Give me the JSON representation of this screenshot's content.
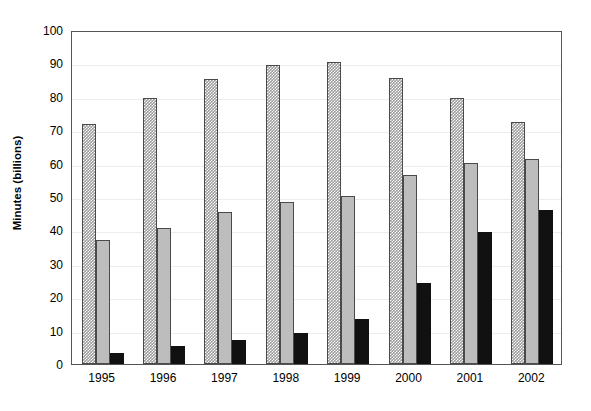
{
  "chart_data": {
    "type": "bar",
    "title": "",
    "subtitle": "",
    "xlabel": "",
    "ylabel": "Minutes (billions)",
    "categories": [
      "1995",
      "1996",
      "1997",
      "1998",
      "1999",
      "2000",
      "2001",
      "2002"
    ],
    "series": [
      {
        "name": "series-1",
        "style": "dotted-pattern-gray",
        "color": "#9a9a9a",
        "values": [
          72.0,
          79.5,
          85.3,
          89.5,
          90.5,
          85.5,
          79.7,
          72.5
        ]
      },
      {
        "name": "series-2",
        "style": "solid-light-gray",
        "color": "#bdbdbd",
        "values": [
          37.0,
          40.8,
          45.5,
          48.5,
          50.3,
          56.5,
          60.3,
          61.5
        ]
      },
      {
        "name": "series-3",
        "style": "solid-black",
        "color": "#111111",
        "values": [
          3.3,
          5.3,
          7.2,
          9.2,
          13.5,
          24.3,
          39.5,
          46.0
        ]
      }
    ],
    "ylim": [
      0,
      100
    ],
    "yticks": [
      0,
      10,
      20,
      30,
      40,
      50,
      60,
      70,
      80,
      90,
      100
    ],
    "ytick_labels": [
      "0",
      "10",
      "20",
      "30",
      "40",
      "50",
      "60",
      "70",
      "80",
      "90",
      "100"
    ],
    "grid": true,
    "grid_axis": "y",
    "legend": "none",
    "legend_position": "none",
    "annotations": [],
    "frame_color": "#555555",
    "gridline_color": "#ededed",
    "background": "#ffffff"
  }
}
